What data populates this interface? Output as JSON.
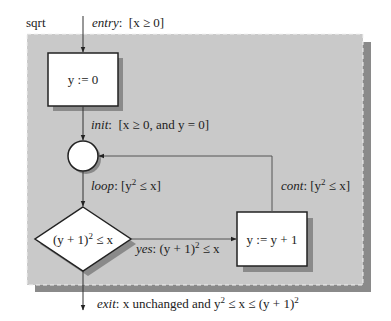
{
  "diagram": {
    "procedure_name": "sqrt",
    "colors": {
      "frame_fill": "#c9c9c9",
      "frame_shadow": "#8a8a8a",
      "node_fill": "#ffffff",
      "stroke": "#222222",
      "edge": "#555555"
    },
    "nodes": {
      "init_box": {
        "label": "y := 0"
      },
      "junction": {
        "label": ""
      },
      "test": {
        "label_pre": "(y + 1)",
        "label_sup": "2",
        "label_post": " ≤ x"
      },
      "incr_box": {
        "label": "y := y + 1"
      }
    },
    "edges": {
      "entry": {
        "name": "entry",
        "sep": ":",
        "text": "  [x ≥ 0]"
      },
      "init": {
        "name": "init",
        "sep": ":",
        "text": "  [x ≥ 0, and y = 0]"
      },
      "loop": {
        "name": "loop",
        "sep": ":",
        "pre": " [y",
        "sup": "2",
        "post": " ≤ x]"
      },
      "yes": {
        "name": "yes",
        "sep": ":",
        "pre": " (y + 1)",
        "sup": "2",
        "post": " ≤ x"
      },
      "cont": {
        "name": "cont",
        "sep": ":",
        "pre": " [y",
        "sup": "2",
        "post": " ≤ x]"
      },
      "exit": {
        "name": "exit",
        "sep": ":",
        "pre": " x unchanged and y",
        "sup": "2",
        "mid": " ≤ x ≤ (y + 1)",
        "sup2": "2"
      }
    }
  }
}
